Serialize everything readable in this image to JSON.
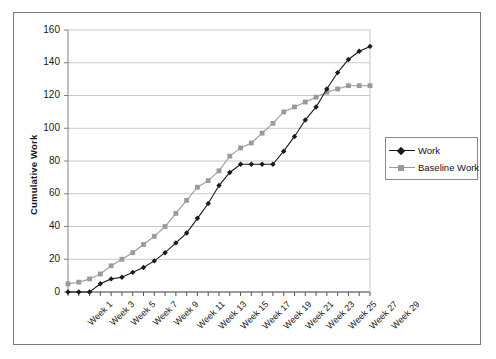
{
  "chart_data": {
    "type": "line",
    "title": "",
    "xlabel": "",
    "ylabel": "Cumulative Work",
    "ylim": [
      0,
      160
    ],
    "ytick_values": [
      0,
      20,
      40,
      60,
      80,
      100,
      120,
      140,
      160
    ],
    "grid": true,
    "legend_position": "right",
    "x": [
      1,
      2,
      3,
      4,
      5,
      6,
      7,
      8,
      9,
      10,
      11,
      12,
      13,
      14,
      15,
      16,
      17,
      18,
      19,
      20,
      21,
      22,
      23,
      24,
      25,
      26,
      27,
      28,
      29
    ],
    "categories": [
      "Week 1",
      "Week 2",
      "Week 3",
      "Week 4",
      "Week 5",
      "Week 6",
      "Week 7",
      "Week 8",
      "Week 9",
      "Week 10",
      "Week 11",
      "Week 12",
      "Week 13",
      "Week 14",
      "Week 15",
      "Week 16",
      "Week 17",
      "Week 18",
      "Week 19",
      "Week 20",
      "Week 21",
      "Week 22",
      "Week 23",
      "Week 24",
      "Week 25",
      "Week 26",
      "Week 27",
      "Week 28",
      "Week 29"
    ],
    "xtick_labels": [
      "Week 1",
      "Week 3",
      "Week 5",
      "Week 7",
      "Week 9",
      "Week 11",
      "Week 13",
      "Week 15",
      "Week 17",
      "Week 19",
      "Week 21",
      "Week 23",
      "Week 25",
      "Week 27",
      "Week 29"
    ],
    "series": [
      {
        "name": "Work",
        "color": "#1a1a1a",
        "marker": "diamond",
        "values": [
          0,
          0,
          0,
          5,
          8,
          9,
          12,
          15,
          19,
          24,
          30,
          36,
          45,
          54,
          65,
          73,
          78,
          78,
          78,
          78,
          86,
          95,
          105,
          113,
          124,
          134,
          142,
          147,
          150
        ]
      },
      {
        "name": "Baseline Work",
        "color": "#9a9a9a",
        "marker": "square",
        "values": [
          5,
          6,
          8,
          11,
          16,
          20,
          24,
          29,
          34,
          40,
          48,
          56,
          64,
          68,
          74,
          83,
          88,
          91,
          97,
          103,
          110,
          113,
          116,
          119,
          122,
          124,
          126,
          126,
          126
        ]
      }
    ]
  },
  "legend": {
    "items": [
      {
        "label": "Work"
      },
      {
        "label": "Baseline Work"
      }
    ]
  },
  "colors": {
    "work": "#1a1a1a",
    "baseline": "#9a9a9a",
    "grid": "#c8c8c8",
    "axis": "#808080",
    "frame": "#7b7b7b"
  }
}
